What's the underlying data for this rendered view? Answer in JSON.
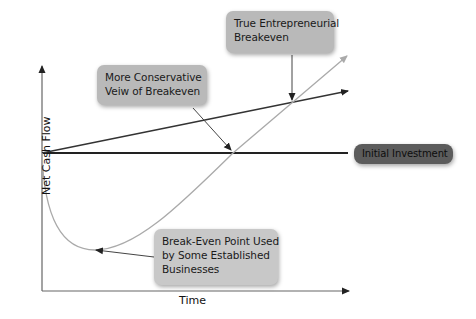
{
  "diagram": {
    "title": "",
    "axes": {
      "x_label": "Time",
      "y_label": "Net Cash Flow"
    },
    "callouts": {
      "true_entrepreneurial": {
        "lines": [
          "True Entrepreneurial",
          "Breakeven"
        ]
      },
      "more_conservative": {
        "lines": [
          "More Conservative",
          "Veiw of Breakeven"
        ]
      },
      "established_businesses": {
        "lines": [
          "Break-Even Point Used",
          "by Some Established",
          "Businesses"
        ]
      },
      "initial_investment": {
        "label": "Initial Investment"
      }
    },
    "series": [
      {
        "name": "Initial Investment line",
        "type": "horizontal",
        "color": "#222222"
      },
      {
        "name": "Conservative breakeven line",
        "type": "straight",
        "color": "#333333"
      },
      {
        "name": "Net cash flow curve (J-curve)",
        "type": "curve",
        "color": "#aaaaaa"
      }
    ],
    "colors": {
      "callout_light": "#b9b9b9",
      "callout_lighter": "#c8c8c8",
      "callout_dark": "#5c5c5c",
      "axis": "#555555",
      "curve": "#aaaaaa",
      "baseline": "#222222"
    }
  }
}
